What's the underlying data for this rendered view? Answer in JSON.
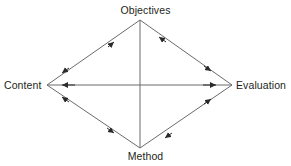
{
  "diagram": {
    "shape": "rhombus",
    "line_color": "#6b6b6b",
    "text_color": "#231f20",
    "background_color": "#ffffff",
    "nodes": [
      {
        "id": "objectives",
        "label": "Objectives",
        "position": "top",
        "x": 140,
        "y": 20
      },
      {
        "id": "content",
        "label": "Content",
        "position": "left",
        "x": 47,
        "y": 85
      },
      {
        "id": "evaluation",
        "label": "Evaluation",
        "position": "right",
        "x": 232,
        "y": 85
      },
      {
        "id": "method",
        "label": "Method",
        "position": "bottom",
        "x": 140,
        "y": 148
      }
    ],
    "edges": [
      {
        "id": "content-objectives",
        "from": "content",
        "to": "objectives",
        "arrows": "both"
      },
      {
        "id": "objectives-evaluation",
        "from": "objectives",
        "to": "evaluation",
        "arrows": "both"
      },
      {
        "id": "content-method",
        "from": "content",
        "to": "method",
        "arrows": "both"
      },
      {
        "id": "method-evaluation",
        "from": "method",
        "to": "evaluation",
        "arrows": "both"
      },
      {
        "id": "content-evaluation",
        "from": "content",
        "to": "evaluation",
        "arrows": "both"
      },
      {
        "id": "objectives-method",
        "from": "objectives",
        "to": "method",
        "arrows": "none"
      }
    ]
  }
}
